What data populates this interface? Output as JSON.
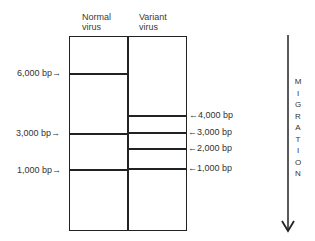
{
  "figure": {
    "type": "gel-electrophoresis-diagram",
    "lanes": [
      {
        "label_line1": "Normal",
        "label_line2": "virus"
      },
      {
        "label_line1": "Variant",
        "label_line2": "virus"
      }
    ],
    "normal_bands": [
      {
        "label": "6,000 bp→",
        "size_bp": 6000
      },
      {
        "label": "3,000 bp→",
        "size_bp": 3000
      },
      {
        "label": "1,000 bp→",
        "size_bp": 1000
      }
    ],
    "variant_bands": [
      {
        "label": "←4,000 bp",
        "size_bp": 4000
      },
      {
        "label": "←3,000 bp",
        "size_bp": 3000
      },
      {
        "label": "←2,000 bp",
        "size_bp": 2000
      },
      {
        "label": "←1,000 bp",
        "size_bp": 1000
      }
    ],
    "migration": {
      "letters": [
        "M",
        "I",
        "G",
        "R",
        "A",
        "T",
        "I",
        "O",
        "N"
      ],
      "direction": "down",
      "icon": "down-arrow-icon"
    },
    "colors": {
      "line": "#222222",
      "background": "#ffffff"
    }
  }
}
